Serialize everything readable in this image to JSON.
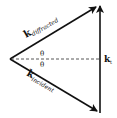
{
  "diagram": {
    "vectors": [
      {
        "id": "k-diffracted",
        "symbol": "k",
        "subscript": "diffracted"
      },
      {
        "id": "k-incident",
        "symbol": "k",
        "subscript": "incident"
      },
      {
        "id": "k-t",
        "symbol": "k",
        "subscript": "t"
      }
    ],
    "angles": [
      {
        "label": "θ",
        "position": "above-dashed-line"
      },
      {
        "label": "θ",
        "position": "below-dashed-line"
      }
    ],
    "colors": {
      "ink": "#111111",
      "dash": "#444444"
    }
  }
}
